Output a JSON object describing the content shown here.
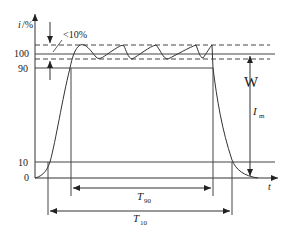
{
  "diagram": {
    "type": "current-waveform-timing",
    "y_axis": {
      "label_var": "i",
      "label_unit": "/%",
      "ticks": [
        "100",
        "90",
        "10",
        "0"
      ]
    },
    "x_axis": {
      "label": "t"
    },
    "annotations": {
      "ripple": "<10%",
      "amplitude_var": "I",
      "amplitude_sub": "m",
      "t90_var": "T",
      "t90_sub": "90",
      "t10_var": "T",
      "t10_sub": "10",
      "w_marker": "W"
    },
    "colors": {
      "line": "#333333",
      "background": "#ffffff"
    }
  }
}
